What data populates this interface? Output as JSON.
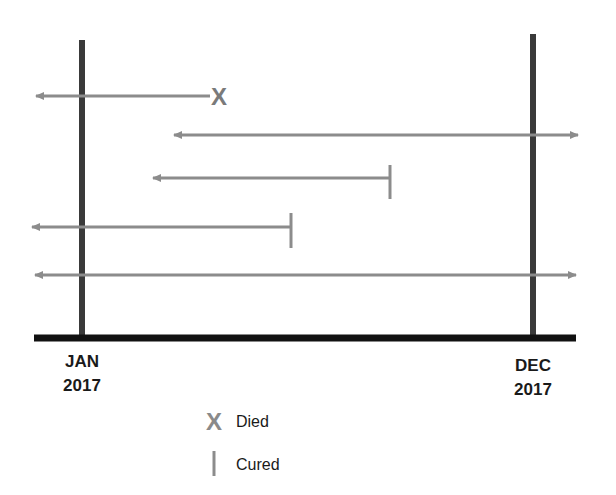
{
  "diagram": {
    "type": "patient-timeline",
    "colors": {
      "period_bar": "#3a3a3a",
      "baseline": "#111111",
      "patient_line": "#8c8c8c",
      "marker": "#8a8a8a",
      "text": "#1a1a1a"
    },
    "period": {
      "start": {
        "month": "JAN",
        "year": "2017"
      },
      "end": {
        "month": "DEC",
        "year": "2017"
      }
    },
    "patients": [
      {
        "id": 1,
        "left": "arrow",
        "right": "died",
        "left_end_x": 36,
        "right_end_x": 210,
        "y": 96
      },
      {
        "id": 2,
        "left": "arrow",
        "right": "arrow",
        "left_end_x": 172,
        "right_end_x": 580,
        "y": 135
      },
      {
        "id": 3,
        "left": "arrow",
        "right": "cured",
        "left_end_x": 151,
        "right_end_x": 390,
        "y": 178
      },
      {
        "id": 4,
        "left": "arrow",
        "right": "cured",
        "left_end_x": 30,
        "right_end_x": 291,
        "y": 227
      },
      {
        "id": 5,
        "left": "arrow",
        "right": "arrow",
        "left_end_x": 33,
        "right_end_x": 578,
        "y": 275
      }
    ],
    "markers": {
      "died_symbol": "X",
      "cured_symbol": "|"
    },
    "legend": [
      {
        "symbol": "X",
        "label": "Died"
      },
      {
        "symbol": "|",
        "label": "Cured"
      }
    ]
  }
}
